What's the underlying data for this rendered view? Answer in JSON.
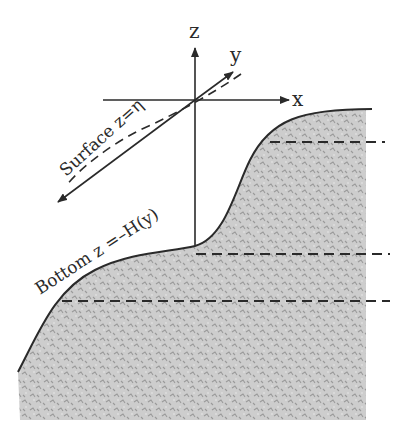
{
  "diagram": {
    "axes": {
      "z_label": "z",
      "y_label": "y",
      "x_label": "x"
    },
    "labels": {
      "surface": "Surface z=η",
      "bottom": "Bottom z =–H(y)"
    },
    "colors": {
      "line": "#2a2a2a",
      "seabed_fill": "#c9c9c9",
      "seabed_texture": "#9a9a9a",
      "background": "#ffffff"
    },
    "dashed_levels": 3
  }
}
